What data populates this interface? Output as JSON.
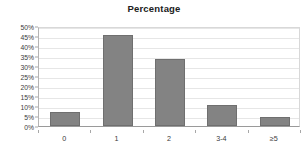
{
  "chart_data": {
    "type": "bar",
    "title": "Percentage",
    "xlabel": "",
    "ylabel": "",
    "categories": [
      "0",
      "1",
      "2",
      "3-4",
      "≥5"
    ],
    "values": [
      7.0,
      45.5,
      33.5,
      10.3,
      4.5
    ],
    "ylim": [
      0,
      50
    ],
    "ytick_labels": [
      "50%",
      "45%",
      "40%",
      "35%",
      "30%",
      "25%",
      "20%",
      "15%",
      "10%",
      "5%",
      "0%"
    ],
    "ytick_values": [
      50,
      45,
      40,
      35,
      30,
      25,
      20,
      15,
      10,
      5,
      0
    ],
    "grid": true,
    "legend": false,
    "series": [
      {
        "name": "Percentage",
        "values": [
          7.0,
          45.5,
          33.5,
          10.3,
          4.5
        ]
      }
    ],
    "colors": {
      "bar_fill": "#838383",
      "bar_border": "#6f6f6f",
      "gridline": "#e6e6e6",
      "axis": "#9a9a9a",
      "text": "#3a3a3a",
      "title": "#202020",
      "background": "#ffffff"
    }
  }
}
